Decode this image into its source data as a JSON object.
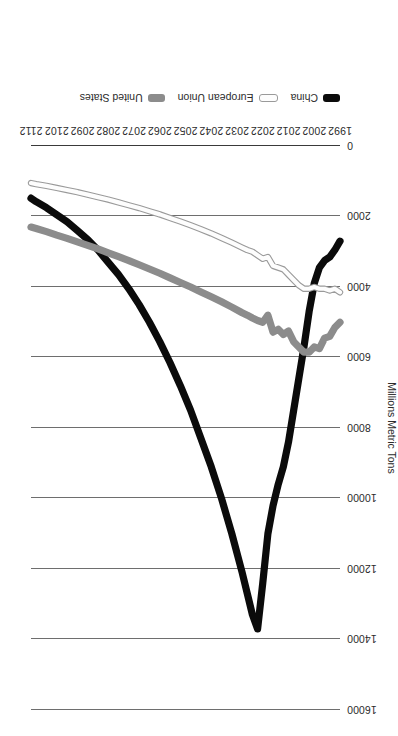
{
  "chart_data": {
    "type": "line",
    "title": "",
    "subtitle": "",
    "xlabel": "",
    "ylabel": "Millions Metric Tons",
    "grid": true,
    "legend_position": "bottom",
    "xlim": [
      1992,
      2112
    ],
    "ylim": [
      0,
      16000
    ],
    "y_ticks": [
      "0",
      "2000",
      "4000",
      "6000",
      "8000",
      "10000",
      "12000",
      "14000",
      "16000"
    ],
    "y_tick_values": [
      0,
      2000,
      4000,
      6000,
      8000,
      10000,
      12000,
      14000,
      16000
    ],
    "x_ticks": [
      "1992",
      "2002",
      "2012",
      "2022",
      "2032",
      "2042",
      "2052",
      "2062",
      "2072",
      "2082",
      "2092",
      "2102",
      "2112"
    ],
    "x_tick_values": [
      1992,
      2002,
      2012,
      2022,
      2032,
      2042,
      2052,
      2062,
      2072,
      2082,
      2092,
      2102,
      2112
    ],
    "x": [
      1992,
      1994,
      1996,
      1998,
      2000,
      2002,
      2004,
      2006,
      2008,
      2010,
      2012,
      2014,
      2016,
      2018,
      2020,
      2022,
      2024,
      2026,
      2028,
      2030,
      2034,
      2038,
      2042,
      2046,
      2050,
      2054,
      2058,
      2062,
      2066,
      2070,
      2074,
      2078,
      2082,
      2086,
      2090,
      2094,
      2098,
      2102,
      2106,
      2110,
      2112
    ],
    "series": [
      {
        "name": "China",
        "color": "#0b0b0b",
        "style": "thick-solid",
        "values": [
          2700,
          2950,
          3150,
          3250,
          3450,
          3900,
          4700,
          5700,
          6600,
          7500,
          8400,
          9100,
          9600,
          10200,
          11000,
          12400,
          13700,
          13300,
          12700,
          12100,
          11000,
          10000,
          9100,
          8300,
          7500,
          6800,
          6150,
          5550,
          5000,
          4500,
          4050,
          3650,
          3300,
          2950,
          2650,
          2400,
          2150,
          1950,
          1750,
          1580,
          1480
        ]
      },
      {
        "name": "European Union",
        "color": "#fdfdfd",
        "style": "thin-outlined",
        "values": [
          4150,
          4050,
          4100,
          4050,
          4050,
          4000,
          4050,
          4050,
          3950,
          3800,
          3650,
          3500,
          3450,
          3400,
          3150,
          3200,
          3100,
          3000,
          2950,
          2880,
          2740,
          2610,
          2480,
          2360,
          2250,
          2140,
          2040,
          1940,
          1850,
          1760,
          1680,
          1600,
          1520,
          1450,
          1380,
          1310,
          1250,
          1190,
          1130,
          1080,
          1050
        ]
      },
      {
        "name": "United States",
        "color": "#8c8c8c",
        "style": "thick-solid",
        "values": [
          5000,
          5150,
          5400,
          5450,
          5750,
          5700,
          5850,
          5850,
          5700,
          5550,
          5250,
          5350,
          5200,
          5280,
          4800,
          5000,
          4950,
          4880,
          4800,
          4730,
          4570,
          4420,
          4280,
          4140,
          4000,
          3870,
          3740,
          3610,
          3490,
          3370,
          3250,
          3140,
          3030,
          2920,
          2820,
          2720,
          2620,
          2530,
          2430,
          2340,
          2300
        ]
      }
    ],
    "annotations": []
  },
  "legend": {
    "entries": [
      {
        "label": "China",
        "swatch": "china-line-swatch"
      },
      {
        "label": "European Union",
        "swatch": "european-union-line-swatch"
      },
      {
        "label": "United States",
        "swatch": "united-states-line-swatch"
      }
    ]
  }
}
